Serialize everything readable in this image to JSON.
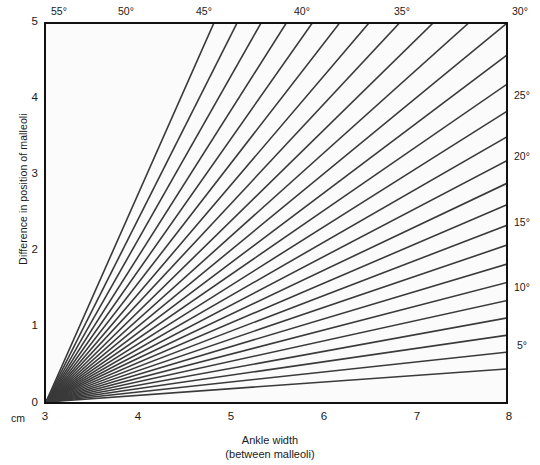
{
  "chart_data": {
    "type": "line",
    "title": "",
    "subtitle": "",
    "xlabel": "Ankle width",
    "xlabel_sub": "(between malleoli)",
    "ylabel": "Difference in position of malleoli",
    "x_unit_label": "cm",
    "xlim": [
      3,
      8
    ],
    "ylim": [
      0,
      5
    ],
    "xticks": [
      3,
      4,
      5,
      6,
      7,
      8
    ],
    "xtick_labels": [
      "3",
      "4",
      "5",
      "6",
      "7",
      "8"
    ],
    "yticks": [
      0,
      1,
      2,
      3,
      4,
      5
    ],
    "ytick_labels": [
      "0",
      "1",
      "2",
      "3",
      "4",
      "5"
    ],
    "grid": false,
    "legend": "none",
    "series": [
      {
        "name": "5°",
        "angle_deg": 5,
        "labeled": true,
        "label_side": "right",
        "x": [
          3,
          8
        ],
        "values": [
          0,
          0.437
        ]
      },
      {
        "name": "7.5°",
        "angle_deg": 7.5,
        "labeled": false,
        "label_side": "right",
        "x": [
          3,
          8
        ],
        "values": [
          0,
          0.658
        ]
      },
      {
        "name": "10°",
        "angle_deg": 10,
        "labeled": true,
        "label_side": "right",
        "x": [
          3,
          8
        ],
        "values": [
          0,
          0.882
        ]
      },
      {
        "name": "12.5°",
        "angle_deg": 12.5,
        "labeled": false,
        "label_side": "right",
        "x": [
          3,
          8
        ],
        "values": [
          0,
          1.109
        ]
      },
      {
        "name": "15°",
        "angle_deg": 15,
        "labeled": true,
        "label_side": "right",
        "x": [
          3,
          8
        ],
        "values": [
          0,
          1.34
        ]
      },
      {
        "name": "17.5°",
        "angle_deg": 17.5,
        "labeled": false,
        "label_side": "right",
        "x": [
          3,
          8
        ],
        "values": [
          0,
          1.577
        ]
      },
      {
        "name": "20°",
        "angle_deg": 20,
        "labeled": true,
        "label_side": "right",
        "x": [
          3,
          8
        ],
        "values": [
          0,
          1.82
        ]
      },
      {
        "name": "22.5°",
        "angle_deg": 22.5,
        "labeled": false,
        "label_side": "right",
        "x": [
          3,
          8
        ],
        "values": [
          0,
          2.071
        ]
      },
      {
        "name": "25°",
        "angle_deg": 25,
        "labeled": true,
        "label_side": "right",
        "x": [
          3,
          8
        ],
        "values": [
          0,
          2.332
        ]
      },
      {
        "name": "27.5°",
        "angle_deg": 27.5,
        "labeled": false,
        "label_side": "right",
        "x": [
          3,
          8
        ],
        "values": [
          0,
          2.603
        ]
      },
      {
        "name": "30°",
        "angle_deg": 30,
        "labeled": true,
        "label_side": "top",
        "x": [
          3,
          8
        ],
        "values": [
          0,
          2.887
        ]
      },
      {
        "name": "32.5°",
        "angle_deg": 32.5,
        "labeled": false,
        "label_side": "top",
        "x": [
          3,
          8
        ],
        "values": [
          0,
          3.186
        ]
      },
      {
        "name": "35°",
        "angle_deg": 35,
        "labeled": true,
        "label_side": "top",
        "x": [
          3,
          8
        ],
        "values": [
          0,
          3.501
        ]
      },
      {
        "name": "37.5°",
        "angle_deg": 37.5,
        "labeled": false,
        "label_side": "top",
        "x": [
          3,
          8
        ],
        "values": [
          0,
          3.837
        ]
      },
      {
        "name": "40°",
        "angle_deg": 40,
        "labeled": true,
        "label_side": "top",
        "x": [
          3,
          8
        ],
        "values": [
          0,
          4.195
        ]
      },
      {
        "name": "42.5°",
        "angle_deg": 42.5,
        "labeled": false,
        "label_side": "top",
        "x": [
          3,
          8
        ],
        "values": [
          0,
          4.58
        ]
      },
      {
        "name": "45°",
        "angle_deg": 45,
        "labeled": true,
        "label_side": "top",
        "x": [
          3,
          8
        ],
        "values": [
          0,
          5.0
        ]
      },
      {
        "name": "47.5°",
        "angle_deg": 47.5,
        "labeled": false,
        "label_side": "top",
        "x": [
          3,
          8
        ],
        "values": [
          0,
          5.456
        ]
      },
      {
        "name": "50°",
        "angle_deg": 50,
        "labeled": true,
        "label_side": "top",
        "x": [
          3,
          8
        ],
        "values": [
          0,
          5.958
        ]
      },
      {
        "name": "52.5°",
        "angle_deg": 52.5,
        "labeled": false,
        "label_side": "top",
        "x": [
          3,
          8
        ],
        "values": [
          0,
          6.525
        ]
      },
      {
        "name": "55°",
        "angle_deg": 55,
        "labeled": true,
        "label_side": "top",
        "x": [
          3,
          8
        ],
        "values": [
          0,
          7.141
        ]
      },
      {
        "name": "57.5°",
        "angle_deg": 57.5,
        "labeled": false,
        "label_side": "top",
        "x": [
          3,
          8
        ],
        "values": [
          0,
          7.855
        ]
      },
      {
        "name": "60°",
        "angle_deg": 60,
        "labeled": false,
        "label_side": "top",
        "x": [
          3,
          8
        ],
        "values": [
          0,
          8.66
        ]
      },
      {
        "name": "62.5°",
        "angle_deg": 62.5,
        "labeled": false,
        "label_side": "top",
        "x": [
          3,
          8
        ],
        "values": [
          0,
          9.596
        ]
      },
      {
        "name": "65°",
        "angle_deg": 65,
        "labeled": false,
        "label_side": "top",
        "x": [
          3,
          8
        ],
        "values": [
          0,
          10.723
        ]
      },
      {
        "name": "67.5°",
        "angle_deg": 67.5,
        "labeled": false,
        "label_side": "top",
        "x": [
          3,
          8
        ],
        "values": [
          0,
          12.071
        ]
      },
      {
        "name": "70°",
        "angle_deg": 70,
        "labeled": false,
        "label_side": "top",
        "x": [
          3,
          8
        ],
        "values": [
          0,
          13.737
        ]
      }
    ],
    "top_axis": {
      "title": "",
      "labels": [
        "55°",
        "50°",
        "45°",
        "40°",
        "35°",
        "30°"
      ]
    },
    "right_axis": {
      "title": "",
      "labels": [
        "25°",
        "20°",
        "15°",
        "10°",
        "5°"
      ]
    },
    "colors": {
      "line": "#3a3a3a",
      "frame": "#111111",
      "plot_background": "#fbfbfb",
      "page_background": "#ffffff",
      "text": "#1a1a1a"
    }
  }
}
